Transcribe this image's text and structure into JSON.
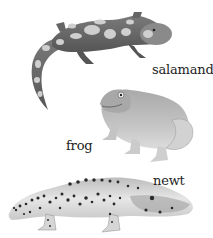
{
  "figure": {
    "style": "grayscale illustration",
    "animals": [
      {
        "id": "salamander",
        "label": "salamander",
        "pattern": "light blotches on dark body"
      },
      {
        "id": "frog",
        "label": "frog",
        "pattern": "plain smooth skin"
      },
      {
        "id": "newt",
        "label": "newt",
        "pattern": "dark spots on light body"
      }
    ]
  },
  "colors": {
    "background": "#ffffff",
    "salamander_body": "#6a6a6a",
    "salamander_spots": "#c8c8c8",
    "frog_body": "#b8b8b8",
    "newt_body": "#d9d9d9",
    "newt_spots": "#2a2a2a",
    "label_text": "#222222"
  }
}
